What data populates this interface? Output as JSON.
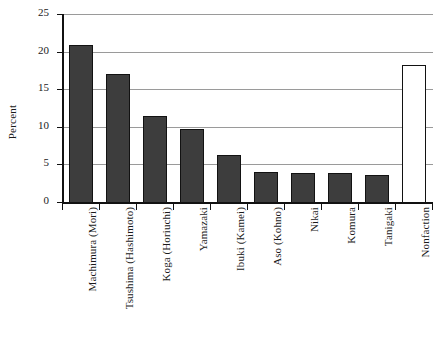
{
  "chart_data": {
    "type": "bar",
    "title": "",
    "xlabel": "",
    "ylabel": "Percent",
    "ylim": [
      0,
      25
    ],
    "yticks": [
      0,
      5,
      10,
      15,
      20,
      25
    ],
    "grid": true,
    "legend": "none",
    "categories": [
      "Machimura (Mori)",
      "Tsushima (Hashimoto)",
      "Koga (Horiuchi)",
      "Yamazaki",
      "Ibuki (Kamei)",
      "Aso (Kohno)",
      "Nikai",
      "Komura",
      "Tanigaki",
      "Nonfaction"
    ],
    "values": [
      21.0,
      17.1,
      11.6,
      9.9,
      6.4,
      4.1,
      4.0,
      4.0,
      3.7,
      18.3
    ],
    "bar_styles": [
      "filled",
      "filled",
      "filled",
      "filled",
      "filled",
      "filled",
      "filled",
      "filled",
      "filled",
      "open"
    ],
    "colors": {
      "bar_fill": "#3d3d3d",
      "bar_open_fill": "#ffffff",
      "bar_border": "#121212",
      "gridline": "#9a9a9a",
      "axis": "#111111",
      "background": "#ffffff"
    }
  }
}
